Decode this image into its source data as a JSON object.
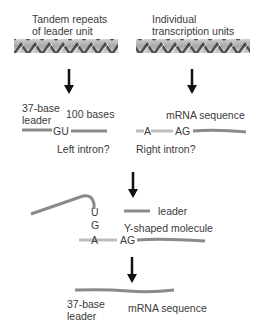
{
  "stage1": {
    "left_label_line1": "Tandem repeats",
    "left_label_line2": "of leader unit",
    "right_label_line1": "Individual",
    "right_label_line2": "transcription units"
  },
  "stage2": {
    "left": {
      "leader_line1": "37-base",
      "leader_line2": "leader",
      "length_label": "100 bases",
      "splice_site": "GU",
      "caption": "Left intron?"
    },
    "right": {
      "title": "mRNA sequence",
      "branch_base": "A",
      "splice_site": "AG",
      "caption": "Right intron?"
    }
  },
  "stage3": {
    "stem_bases": [
      "U",
      "G",
      "A"
    ],
    "splice_site": "AG",
    "leader_label": "leader",
    "caption": "Y-shaped molecule"
  },
  "stage4": {
    "leader_line1": "37-base",
    "leader_line2": "leader",
    "mrna_label": "mRNA sequence"
  },
  "colors": {
    "strand": "#8a8a8a",
    "intron": "#bdbdbd",
    "arrow": "#111111",
    "text": "#3a3a3a"
  }
}
